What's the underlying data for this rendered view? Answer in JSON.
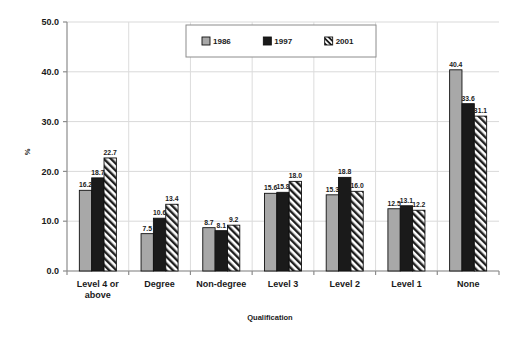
{
  "chart_data": {
    "type": "bar",
    "title": "",
    "xlabel": "Qualification",
    "ylabel": "%",
    "ylim": [
      0.0,
      50.0
    ],
    "ytick_step": 10.0,
    "ytick_labels": [
      "0.0",
      "10.0",
      "20.0",
      "30.0",
      "40.0",
      "50.0"
    ],
    "grid": "horizontal-and-vertical",
    "legend_position": "top-center",
    "categories": [
      "Level 4 or above",
      "Degree",
      "Non-degree",
      "Level 3",
      "Level 2",
      "Level 1",
      "None"
    ],
    "category_lines": [
      [
        "Level 4 or",
        "above"
      ],
      [
        "Degree"
      ],
      [
        "Non-degree"
      ],
      [
        "Level 3"
      ],
      [
        "Level 2"
      ],
      [
        "Level 1"
      ],
      [
        "None"
      ]
    ],
    "series": [
      {
        "name": "1986",
        "fill": "#a8a8a8",
        "pattern": "solid",
        "values": [
          16.2,
          7.5,
          8.7,
          15.6,
          15.3,
          12.5,
          40.4
        ],
        "labels": [
          "16.2",
          "7.5",
          "8.7",
          "15.6",
          "15.3",
          "12.5",
          "40.4"
        ]
      },
      {
        "name": "1997",
        "fill": "#1a1a1a",
        "pattern": "solid",
        "values": [
          18.7,
          10.6,
          8.1,
          15.8,
          18.8,
          13.1,
          33.6
        ],
        "labels": [
          "18.7",
          "10.6",
          "8.1",
          "15.8",
          "18.8",
          "13.1",
          "33.6"
        ]
      },
      {
        "name": "2001",
        "fill": "#ffffff",
        "pattern": "diagonal-hatch",
        "values": [
          22.7,
          13.4,
          9.2,
          18.0,
          16.0,
          12.2,
          31.1
        ],
        "labels": [
          "22.7",
          "13.4",
          "9.2",
          "18.0",
          "16.0",
          "12.2",
          "31.1"
        ]
      }
    ]
  },
  "legend": {
    "entries": [
      "1986",
      "1997",
      "2001"
    ]
  }
}
